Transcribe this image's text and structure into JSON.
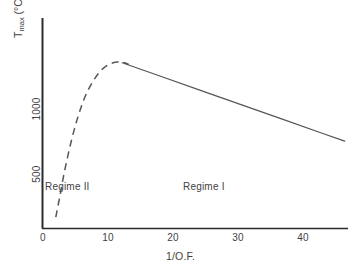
{
  "chart_data": {
    "type": "line",
    "title": "",
    "subtitle": "",
    "xlabel": "1/O.F.",
    "ylabel": "T_max (°C)",
    "ylabel_base": "T",
    "ylabel_sub": "max",
    "ylabel_unit": " (°C)",
    "xlim": [
      0,
      46
    ],
    "ylim": [
      330,
      1260
    ],
    "xticks": [
      0,
      10,
      20,
      30,
      40
    ],
    "xtick_labels": [
      "0",
      "10",
      "20",
      "30",
      "40"
    ],
    "yticks": [
      500,
      1000
    ],
    "ytick_labels": [
      "500",
      "1000"
    ],
    "grid": false,
    "legend": "none",
    "line_color": "#555555",
    "axis_color": "#2b2b2b",
    "series": [
      {
        "name": "Regime II (extrapolated)",
        "style": "dashed",
        "color": "#555555",
        "x": [
          2.0,
          2.6,
          3.3,
          4.2,
          5.2,
          6.3,
          7.5,
          8.7,
          10.0,
          11.2,
          12.2,
          13.0
        ],
        "y": [
          380,
          470,
          580,
          700,
          810,
          905,
          975,
          1025,
          1055,
          1065,
          1063,
          1055
        ]
      },
      {
        "name": "Regime I",
        "style": "solid",
        "color": "#555555",
        "x": [
          12.0,
          18.0,
          24.0,
          30.0,
          36.0,
          42.0,
          45.5
        ],
        "y": [
          1062,
          1000,
          938,
          876,
          814,
          752,
          716
        ]
      }
    ],
    "annotations": [
      {
        "name": "regime-two",
        "text": "Regime II",
        "x": 2.5,
        "y": 415
      },
      {
        "name": "regime-one",
        "text": "Regime I",
        "x": 21.5,
        "y": 415
      }
    ]
  },
  "axes": {
    "x_title": "1/O.F.",
    "y_title_base": "T",
    "y_title_sub": "max",
    "y_title_unit": " (°C)",
    "xtick_0": "0",
    "xtick_1": "10",
    "xtick_2": "20",
    "xtick_3": "30",
    "xtick_4": "40",
    "ytick_0": "500",
    "ytick_1": "1000"
  },
  "labels": {
    "regime_two": "Regime II",
    "regime_one": "Regime I"
  }
}
